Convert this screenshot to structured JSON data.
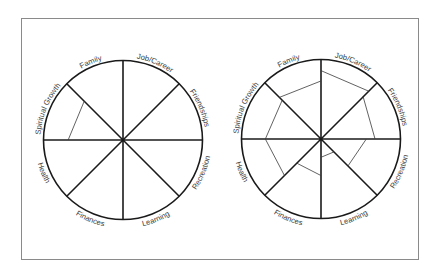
{
  "diagram": {
    "type": "wheel-of-life",
    "colors": {
      "line": "#1a1a1a",
      "level_line": "#3a3a3a",
      "label": "#3a3a3a",
      "frame": "#8a8a8a"
    },
    "categories": [
      "Job/Career",
      "Friendships",
      "Recreation",
      "Learning",
      "Finances",
      "Health",
      "Spiritual Growth",
      "Family"
    ],
    "wheels": [
      {
        "name": "blank-example-wheel",
        "levels": [
          {
            "category": "Spiritual Growth",
            "start": 0.69,
            "end": 0.69
          }
        ]
      },
      {
        "name": "completed-wheel",
        "levels": [
          {
            "category": "Job/Career",
            "start": 0.86,
            "end": 0.85
          },
          {
            "category": "Friendships",
            "start": 0.75,
            "end": 0.68
          },
          {
            "category": "Recreation",
            "start": 0.57,
            "end": 0.48
          },
          {
            "category": "Learning",
            "start": 0.23,
            "end": 0.23
          },
          {
            "category": "Finances",
            "start": 0.46,
            "end": 0.43
          },
          {
            "category": "Health",
            "start": 0.65,
            "end": 0.7
          },
          {
            "category": "Spiritual Growth",
            "start": 0.7,
            "end": 0.69
          },
          {
            "category": "Family",
            "start": 0.74,
            "end": 0.73
          }
        ]
      }
    ]
  }
}
